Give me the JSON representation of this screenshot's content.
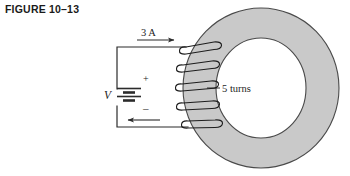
{
  "figure": {
    "caption": "FIGURE 10–13"
  },
  "diagram": {
    "type": "toroid-coil-circuit",
    "labels": {
      "current": "3 A",
      "source": "V",
      "turns": "5 turns",
      "terminal_positive": "+",
      "terminal_negative": "–"
    },
    "icons": {
      "current_arrow": "arrow-right-icon",
      "return_arrow": "arrow-left-icon",
      "battery": "battery-symbol-icon",
      "toroid": "toroid-core-icon",
      "winding": "coil-winding-icon"
    },
    "colors": {
      "core_fill": "#c9c9c9",
      "core_stroke": "#4a4a4a",
      "wire": "#2b2b2b",
      "text": "#1d1d1d",
      "caption": "#1a1a1a",
      "background": "#ffffff"
    },
    "geometry": {
      "toroid_center_x": 261,
      "toroid_center_y": 88,
      "toroid_outer_rx": 78,
      "toroid_outer_ry": 80,
      "toroid_inner_rx": 45,
      "toroid_inner_ry": 50,
      "turns_count": 5
    }
  }
}
